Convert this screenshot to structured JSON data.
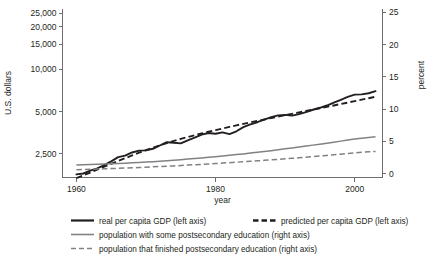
{
  "chart_data": {
    "type": "line",
    "title": "",
    "xlabel": "year",
    "ylabel": "U.S. dollars",
    "y2label": "percent",
    "grid": false,
    "legend_position": "bottom",
    "x": [
      1960,
      1961,
      1962,
      1963,
      1964,
      1965,
      1966,
      1967,
      1968,
      1969,
      1970,
      1971,
      1972,
      1973,
      1974,
      1975,
      1976,
      1977,
      1978,
      1979,
      1980,
      1981,
      1982,
      1983,
      1984,
      1985,
      1986,
      1987,
      1988,
      1989,
      1990,
      1991,
      1992,
      1993,
      1994,
      1995,
      1996,
      1997,
      1998,
      1999,
      2000,
      2001,
      2002,
      2003
    ],
    "xlim": [
      1958,
      2004
    ],
    "xticks": [
      1960,
      1980,
      2000
    ],
    "xtick_labels": [
      "1960",
      "1980",
      "2000"
    ],
    "y_scale": "log",
    "ylim": [
      1700,
      27000
    ],
    "yticks": [
      2500,
      5000,
      10000,
      15000,
      20000,
      25000
    ],
    "ytick_labels": [
      "2,500",
      "5,000",
      "10,000",
      "15,000",
      "20,000",
      "25,000"
    ],
    "y2_scale": "linear",
    "y2lim": [
      -0.6,
      25.6
    ],
    "y2ticks": [
      0,
      5,
      10,
      15,
      20,
      25
    ],
    "y2tick_labels": [
      "0",
      "5",
      "10",
      "15",
      "20",
      "25"
    ],
    "series": [
      {
        "name": "real per capita GDP (left axis)",
        "axis": "left",
        "style": "solid",
        "color": "#231f20",
        "values": [
          1790,
          1815,
          1900,
          1975,
          2080,
          2215,
          2370,
          2430,
          2560,
          2640,
          2650,
          2720,
          2870,
          3030,
          3000,
          2970,
          3125,
          3260,
          3430,
          3520,
          3480,
          3560,
          3460,
          3620,
          3880,
          4060,
          4200,
          4380,
          4560,
          4700,
          4740,
          4680,
          4800,
          4950,
          5150,
          5320,
          5520,
          5790,
          6060,
          6350,
          6600,
          6620,
          6750,
          6980
        ]
      },
      {
        "name": "predicted per capita GDP (left axis)",
        "axis": "left",
        "style": "dashed",
        "color": "#231f20",
        "values": [
          1680,
          1760,
          1845,
          1935,
          2030,
          2125,
          2225,
          2330,
          2440,
          2550,
          2660,
          2770,
          2880,
          2990,
          3095,
          3195,
          3295,
          3395,
          3495,
          3595,
          3695,
          3790,
          3890,
          3990,
          4090,
          4190,
          4290,
          4395,
          4500,
          4605,
          4710,
          4820,
          4930,
          5045,
          5160,
          5280,
          5400,
          5525,
          5655,
          5790,
          5930,
          6075,
          6220,
          6370
        ]
      },
      {
        "name": "population with some postsecondary education (right axis)",
        "axis": "right",
        "style": "solid",
        "color": "#808285",
        "values": [
          1.35,
          1.38,
          1.41,
          1.44,
          1.48,
          1.52,
          1.57,
          1.62,
          1.67,
          1.73,
          1.79,
          1.86,
          1.93,
          2.0,
          2.08,
          2.16,
          2.25,
          2.34,
          2.43,
          2.53,
          2.63,
          2.73,
          2.84,
          2.95,
          3.06,
          3.18,
          3.3,
          3.43,
          3.56,
          3.7,
          3.84,
          3.98,
          4.12,
          4.27,
          4.42,
          4.57,
          4.72,
          4.88,
          5.04,
          5.2,
          5.36,
          5.5,
          5.62,
          5.72
        ]
      },
      {
        "name": "population that finished postsecondary education (right axis)",
        "axis": "right",
        "style": "dashed",
        "color": "#808285",
        "values": [
          0.62,
          0.64,
          0.67,
          0.7,
          0.74,
          0.78,
          0.82,
          0.86,
          0.9,
          0.95,
          1.0,
          1.05,
          1.1,
          1.15,
          1.2,
          1.26,
          1.32,
          1.38,
          1.44,
          1.5,
          1.56,
          1.63,
          1.7,
          1.77,
          1.84,
          1.91,
          1.98,
          2.06,
          2.14,
          2.22,
          2.3,
          2.38,
          2.46,
          2.55,
          2.64,
          2.73,
          2.82,
          2.92,
          3.02,
          3.12,
          3.22,
          3.3,
          3.38,
          3.45
        ]
      }
    ],
    "legend_rows": [
      [
        {
          "label": "real per capita GDP (left axis)",
          "style": "solid",
          "color": "#231f20",
          "weight": "bold"
        },
        {
          "label": "predicted per capita GDP (left axis)",
          "style": "dashed",
          "color": "#231f20",
          "weight": "bold"
        }
      ],
      [
        {
          "label": "population with some postsecondary education (right axis)",
          "style": "solid",
          "color": "#808285",
          "weight": "normal"
        }
      ],
      [
        {
          "label": "population that finished postsecondary education (right axis)",
          "style": "dashed",
          "color": "#808285",
          "weight": "normal"
        }
      ]
    ]
  },
  "axes": {
    "left_title": "U.S. dollars",
    "right_title": "percent",
    "bottom_title": "year",
    "left_ticks": [
      "25,000",
      "20,000",
      "15,000",
      "10,000",
      "5,000",
      "2,500"
    ],
    "right_ticks": [
      "25",
      "20",
      "15",
      "10",
      "5",
      "0"
    ],
    "bottom_ticks": [
      "1960",
      "1980",
      "2000"
    ]
  },
  "legend": {
    "items": [
      "real per capita GDP (left axis)",
      "predicted per capita GDP (left axis)",
      "population with some postsecondary education (right axis)",
      "population that finished postsecondary education (right axis)"
    ]
  },
  "colors": {
    "ink": "#231f20",
    "gray": "#808285",
    "spine": "#6d6e71",
    "background": "#ffffff"
  }
}
